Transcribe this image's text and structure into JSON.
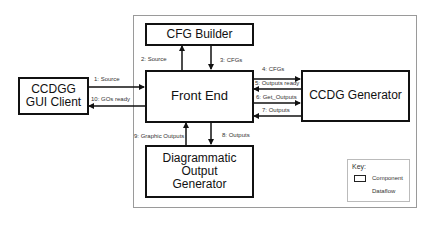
{
  "diagram": {
    "components": {
      "cfg_builder": "CFG Builder",
      "front_end": "Front End",
      "ccdg_generator": "CCDG Generator",
      "gui_client_line1": "CCDGG",
      "gui_client_line2": "GUI Client",
      "dog_line1": "Diagrammatic",
      "dog_line2": "Output",
      "dog_line3": "Generator"
    },
    "dataflows": [
      {
        "label": "1: Source",
        "from": "CCDGG GUI Client",
        "to": "Front End"
      },
      {
        "label": "2: Source",
        "from": "Front End",
        "to": "CFG Builder"
      },
      {
        "label": "3: CFGs",
        "from": "CFG Builder",
        "to": "Front End"
      },
      {
        "label": "4: CFGs",
        "from": "Front End",
        "to": "CCDG Generator"
      },
      {
        "label": "5: Outputs ready",
        "from": "CCDG Generator",
        "to": "Front End"
      },
      {
        "label": "6: Get_Outputs",
        "from": "Front End",
        "to": "CCDG Generator"
      },
      {
        "label": "7: Outputs",
        "from": "CCDG Generator",
        "to": "Front End"
      },
      {
        "label": "8: Outputs",
        "from": "Front End",
        "to": "Diagrammatic Output Generator"
      },
      {
        "label": "9: Graphic Outputs",
        "from": "Diagrammatic Output Generator",
        "to": "Front End"
      },
      {
        "label": "10: GOs ready",
        "from": "Front End",
        "to": "CCDGG GUI Client"
      }
    ],
    "key": {
      "title": "Key:",
      "component_label": "Component",
      "dataflow_label": "Dataflow"
    },
    "colors": {
      "stroke": "#111111",
      "container_border": "#9a9a9a",
      "label_text": "#333333"
    }
  }
}
